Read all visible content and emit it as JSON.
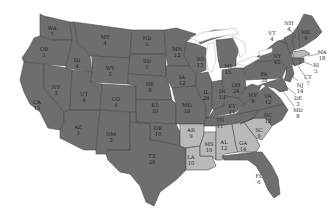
{
  "map": {
    "title": "United States electoral votes by state",
    "colors": {
      "dark": "#6e6e6e",
      "light": "#b9b9b9",
      "border": "#4a4a4a",
      "background": "#ffffff"
    },
    "highlighted_group": [
      "AR",
      "LA",
      "MS",
      "AL",
      "GA",
      "SC"
    ],
    "states": {
      "WA": {
        "abbr": "WA",
        "votes": "7"
      },
      "OR": {
        "abbr": "OR",
        "votes": "5"
      },
      "CA": {
        "abbr": "CA",
        "votes": "13"
      },
      "ID": {
        "abbr": "ID",
        "votes": "4"
      },
      "NV": {
        "abbr": "NV",
        "votes": "3"
      },
      "MT": {
        "abbr": "MT",
        "votes": "4"
      },
      "WY": {
        "abbr": "WY",
        "votes": "3"
      },
      "UT": {
        "abbr": "UT",
        "votes": "4"
      },
      "AZ": {
        "abbr": "AZ",
        "votes": "3"
      },
      "CO": {
        "abbr": "CO",
        "votes": "6"
      },
      "NM": {
        "abbr": "NM",
        "votes": "3"
      },
      "ND": {
        "abbr": "ND",
        "votes": "5"
      },
      "SD": {
        "abbr": "SD",
        "votes": "5"
      },
      "NE": {
        "abbr": "NE",
        "votes": "8"
      },
      "KS": {
        "abbr": "KS",
        "votes": "10"
      },
      "OK": {
        "abbr": "OK",
        "votes": "10"
      },
      "TX": {
        "abbr": "TX",
        "votes": "20"
      },
      "MN": {
        "abbr": "MN",
        "votes": "12"
      },
      "IA": {
        "abbr": "IA",
        "votes": "12"
      },
      "MO": {
        "abbr": "MO",
        "votes": "18"
      },
      "AR": {
        "abbr": "AR",
        "votes": "9"
      },
      "LA": {
        "abbr": "LA",
        "votes": "10"
      },
      "WI": {
        "abbr": "WI",
        "votes": "13"
      },
      "IL": {
        "abbr": "IL",
        "votes": "29"
      },
      "MS": {
        "abbr": "MS",
        "votes": "10"
      },
      "MI": {
        "abbr": "MI",
        "votes": "15"
      },
      "IN": {
        "abbr": "IN",
        "votes": "15"
      },
      "KY": {
        "abbr": "KY",
        "votes": "11"
      },
      "TN": {
        "abbr": "TN",
        "votes": "11"
      },
      "AL": {
        "abbr": "AL",
        "votes": "12"
      },
      "GA": {
        "abbr": "GA",
        "votes": "14"
      },
      "FL": {
        "abbr": "FL",
        "votes": "6"
      },
      "SC": {
        "abbr": "SC",
        "votes": "9"
      },
      "NC": {
        "abbr": "NC",
        "votes": "12"
      },
      "VA": {
        "abbr": "VA",
        "votes": "12"
      },
      "WV": {
        "abbr": "WV",
        "votes": "8"
      },
      "OH": {
        "abbr": "OH",
        "votes": "24"
      },
      "PA": {
        "abbr": "PA",
        "votes": "38"
      },
      "NY": {
        "abbr": "NY",
        "votes": "45"
      },
      "VT": {
        "abbr": "VT",
        "votes": "4"
      },
      "NH": {
        "abbr": "NH",
        "votes": "4"
      },
      "ME": {
        "abbr": "ME",
        "votes": "6"
      },
      "MA": {
        "abbr": "MA",
        "votes": "18"
      },
      "RI": {
        "abbr": "RI",
        "votes": "5"
      },
      "CT": {
        "abbr": "CT",
        "votes": "7"
      },
      "NJ": {
        "abbr": "NJ",
        "votes": "14"
      },
      "DE": {
        "abbr": "DE",
        "votes": "3"
      },
      "MD": {
        "abbr": "MD",
        "votes": "8"
      }
    }
  }
}
